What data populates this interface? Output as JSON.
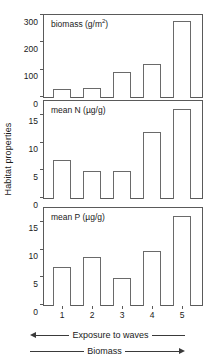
{
  "figure": {
    "group_ylabel": "Habitat properties",
    "x_categories": [
      "1",
      "2",
      "3",
      "4",
      "5"
    ],
    "bottom_axis_labels": {
      "exposure": "Exposure to waves",
      "biomass": "Biomass"
    }
  },
  "chart_data": [
    {
      "type": "bar",
      "title": "biomass (g/m2)",
      "title_main": "biomass (g/m",
      "title_sup": "2",
      "title_tail": ")",
      "categories": [
        "1",
        "2",
        "3",
        "4",
        "5"
      ],
      "values": [
        33,
        37,
        96,
        126,
        281
      ],
      "xlabel": "",
      "ylabel": "biomass (g/m2)",
      "ylim": [
        0,
        300
      ],
      "yticks": [
        0,
        100,
        200,
        300
      ],
      "ytick_labels": [
        "0",
        "100",
        "200",
        "300"
      ],
      "grid": false,
      "legend": "none"
    },
    {
      "type": "bar",
      "title": "mean N (µg/g)",
      "categories": [
        "1",
        "2",
        "3",
        "4",
        "5"
      ],
      "values": [
        7.0,
        5.0,
        5.1,
        12.1,
        16.2
      ],
      "xlabel": "",
      "ylabel": "mean N (µg/g)",
      "ylim": [
        0,
        17.5
      ],
      "yticks": [
        0,
        5,
        10,
        15
      ],
      "ytick_labels": [
        "0",
        "5",
        "10",
        "15"
      ],
      "grid": false,
      "legend": "none"
    },
    {
      "type": "bar",
      "title": "mean P (µg/g)",
      "categories": [
        "1",
        "2",
        "3",
        "4",
        "5"
      ],
      "values": [
        7.0,
        8.8,
        5.1,
        9.9,
        16.2
      ],
      "xlabel": "",
      "ylabel": "mean P (µg/g)",
      "ylim": [
        0,
        17.5
      ],
      "yticks": [
        0,
        5,
        10,
        15
      ],
      "ytick_labels": [
        "0",
        "5",
        "10",
        "15"
      ],
      "grid": false,
      "legend": "none"
    }
  ]
}
